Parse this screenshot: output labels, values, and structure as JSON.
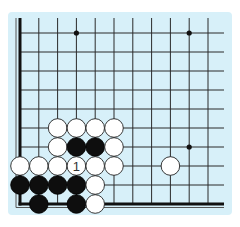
{
  "diagram": {
    "colors": {
      "background": "#d7f0f9",
      "line": "#2a2a2a",
      "black_stone": "#0e0e0e",
      "white_stone": "#ffffff"
    },
    "grid": {
      "origin_x": 20,
      "origin_y": 33,
      "spacing": 18.8,
      "spacing_y": 19,
      "columns": 11,
      "rows": 10,
      "top_extension_y": 18,
      "right_extension_x": 224,
      "edges": [
        "left",
        "bottom"
      ]
    },
    "star_points": [
      {
        "col": 3,
        "row": 0
      },
      {
        "col": 9,
        "row": 0
      },
      {
        "col": 9,
        "row": 6
      }
    ],
    "stones": [
      {
        "col": 2,
        "row": 5,
        "color": "white"
      },
      {
        "col": 3,
        "row": 5,
        "color": "white"
      },
      {
        "col": 4,
        "row": 5,
        "color": "white"
      },
      {
        "col": 5,
        "row": 5,
        "color": "white"
      },
      {
        "col": 2,
        "row": 6,
        "color": "white"
      },
      {
        "col": 3,
        "row": 6,
        "color": "black"
      },
      {
        "col": 4,
        "row": 6,
        "color": "black"
      },
      {
        "col": 5,
        "row": 6,
        "color": "white"
      },
      {
        "col": 0,
        "row": 7,
        "color": "white"
      },
      {
        "col": 1,
        "row": 7,
        "color": "white"
      },
      {
        "col": 2,
        "row": 7,
        "color": "white"
      },
      {
        "col": 3,
        "row": 7,
        "color": "white",
        "label": "1"
      },
      {
        "col": 4,
        "row": 7,
        "color": "white"
      },
      {
        "col": 5,
        "row": 7,
        "color": "white"
      },
      {
        "col": 8,
        "row": 7,
        "color": "white"
      },
      {
        "col": 0,
        "row": 8,
        "color": "black"
      },
      {
        "col": 1,
        "row": 8,
        "color": "black"
      },
      {
        "col": 2,
        "row": 8,
        "color": "black"
      },
      {
        "col": 3,
        "row": 8,
        "color": "black"
      },
      {
        "col": 4,
        "row": 8,
        "color": "white"
      },
      {
        "col": 1,
        "row": 9,
        "color": "black"
      },
      {
        "col": 3,
        "row": 9,
        "color": "black"
      },
      {
        "col": 4,
        "row": 9,
        "color": "white"
      }
    ],
    "move_labels": [
      "1"
    ]
  }
}
